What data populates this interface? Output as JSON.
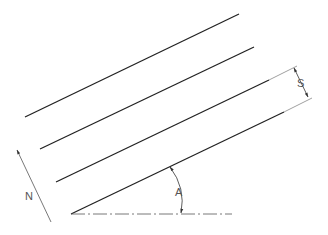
{
  "diagram": {
    "type": "engineering-drawing",
    "labels": {
      "spacing": "S",
      "angle": "A",
      "north": "N"
    },
    "colors": {
      "line": "#222222",
      "thin": "#666666",
      "background": "#ffffff"
    },
    "parallel_lines": [
      {
        "x1": 25,
        "y1": 117,
        "x2": 239,
        "y2": 14
      },
      {
        "x1": 40,
        "y1": 149,
        "x2": 254,
        "y2": 47
      },
      {
        "x1": 56,
        "y1": 182,
        "x2": 269,
        "y2": 80
      },
      {
        "x1": 71,
        "y1": 214,
        "x2": 284,
        "y2": 112
      }
    ]
  }
}
